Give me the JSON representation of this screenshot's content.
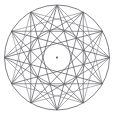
{
  "figure": {
    "background_color": "#ffffff",
    "canvas": {
      "width": 114,
      "height": 116
    },
    "center": {
      "x": 57.0,
      "y": 57.5
    },
    "stroke_color": "#55555b",
    "stroke_color_light": "#8d8d93",
    "stroke_width": 0.7,
    "center_dot": {
      "label": "center-point",
      "radius": 0.9,
      "color": "#3a3a40"
    },
    "outer_circle": {
      "label": "outer-circle",
      "radius": 52.5,
      "stroke": "#55555b",
      "stroke_width": 0.75,
      "fill": "none"
    },
    "inner_circle": {
      "label": "inner-circle",
      "radius": 28.5,
      "stroke": "#6d6d73",
      "stroke_width": 0.7,
      "fill": "none"
    },
    "vertex_count": 12,
    "vertex_angles_deg": [
      -90,
      -60,
      -30,
      0,
      30,
      60,
      90,
      120,
      150,
      180,
      210,
      240
    ],
    "vertices": [
      {
        "i": 0,
        "angle_deg": -90,
        "x": 57.0,
        "y": 5.0
      },
      {
        "i": 1,
        "angle_deg": -60,
        "x": 83.25,
        "y": 12.04
      },
      {
        "i": 2,
        "angle_deg": -30,
        "x": 102.46,
        "y": 31.25
      },
      {
        "i": 3,
        "angle_deg": 0,
        "x": 109.5,
        "y": 57.5
      },
      {
        "i": 4,
        "angle_deg": 30,
        "x": 102.46,
        "y": 83.75
      },
      {
        "i": 5,
        "angle_deg": 60,
        "x": 83.25,
        "y": 102.96
      },
      {
        "i": 6,
        "angle_deg": 90,
        "x": 57.0,
        "y": 110.0
      },
      {
        "i": 7,
        "angle_deg": 120,
        "x": 30.75,
        "y": 102.96
      },
      {
        "i": 8,
        "angle_deg": 150,
        "x": 11.54,
        "y": 83.75
      },
      {
        "i": 9,
        "angle_deg": 180,
        "x": 4.5,
        "y": 57.5
      },
      {
        "i": 10,
        "angle_deg": 210,
        "x": 11.54,
        "y": 31.25
      },
      {
        "i": 11,
        "angle_deg": 240,
        "x": 30.75,
        "y": 12.04
      }
    ],
    "polygons": [
      {
        "name": "star-12-5",
        "schlafli": "{12/5}",
        "step": 5,
        "stroke": "#55555b",
        "stroke_width": 0.7
      },
      {
        "name": "star-12-4-triangles",
        "schlafli": "{12/4}",
        "step": 4,
        "stroke": "#6a6a70",
        "stroke_width": 0.7
      },
      {
        "name": "star-12-3-squares",
        "schlafli": "{12/3}",
        "step": 3,
        "stroke": "#93939a",
        "stroke_width": 0.7
      }
    ]
  }
}
